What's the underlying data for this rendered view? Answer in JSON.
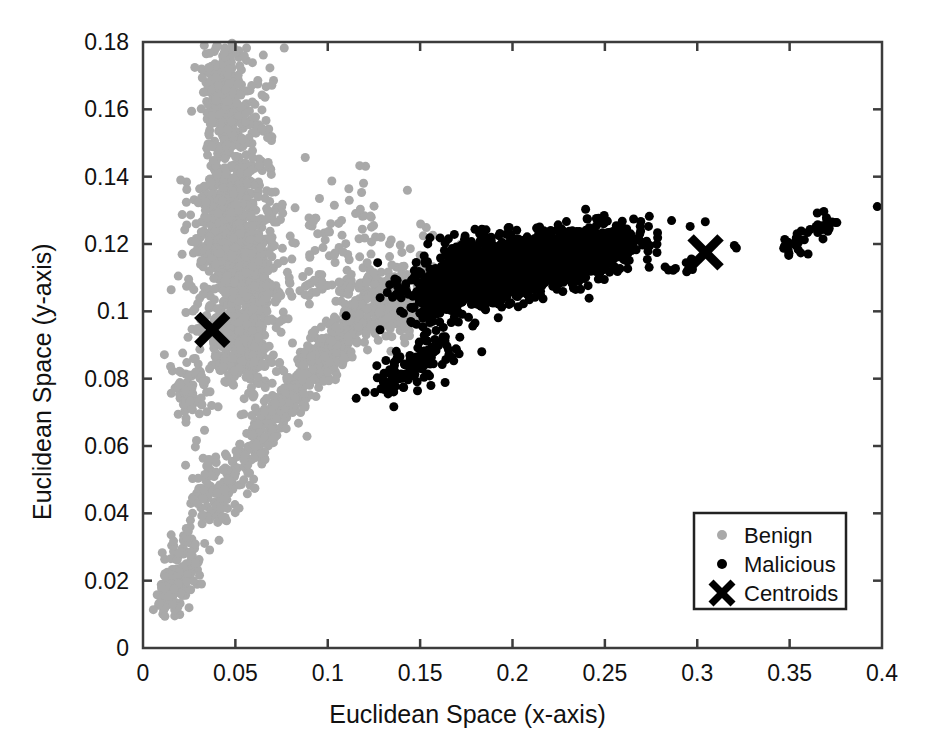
{
  "chart_data": {
    "type": "scatter",
    "title": "",
    "xlabel": "Euclidean Space (x-axis)",
    "ylabel": "Euclidean Space (y-axis)",
    "xlim": [
      0,
      0.4
    ],
    "ylim": [
      0,
      0.18
    ],
    "xticks": [
      0,
      0.05,
      0.1,
      0.15,
      0.2,
      0.25,
      0.3,
      0.35,
      0.4
    ],
    "xtick_labels": [
      "0",
      "0.05",
      "0.1",
      "0.15",
      "0.2",
      "0.25",
      "0.3",
      "0.35",
      "0.4"
    ],
    "yticks": [
      0,
      0.02,
      0.04,
      0.06,
      0.08,
      0.1,
      0.12,
      0.14,
      0.16,
      0.18
    ],
    "ytick_labels": [
      "0",
      "0.02",
      "0.04",
      "0.06",
      "0.08",
      "0.1",
      "0.12",
      "0.14",
      "0.16",
      "0.18"
    ],
    "grid": false,
    "legend_position": "lower right",
    "series": [
      {
        "name": "Benign",
        "marker": "circle",
        "color": "#a9a9a9",
        "marker_size": 9,
        "clusters": [
          {
            "label": "upper-vertical-spine",
            "cx": 0.046,
            "cy": 0.133,
            "sx": 0.0085,
            "sy": 0.0215,
            "n": 520,
            "rot": -0.2
          },
          {
            "label": "upper-spine-top",
            "cx": 0.042,
            "cy": 0.165,
            "sx": 0.0055,
            "sy": 0.0075,
            "n": 190,
            "rot": 0.0
          },
          {
            "label": "spine-mid-bulge",
            "cx": 0.055,
            "cy": 0.117,
            "sx": 0.0105,
            "sy": 0.0135,
            "n": 320,
            "rot": -0.25
          },
          {
            "label": "spine-lower",
            "cx": 0.057,
            "cy": 0.1,
            "sx": 0.0095,
            "sy": 0.0105,
            "n": 240,
            "rot": -0.1
          },
          {
            "label": "spine-foot",
            "cx": 0.052,
            "cy": 0.088,
            "sx": 0.0075,
            "sy": 0.006,
            "n": 120,
            "rot": 0.0
          },
          {
            "label": "diagonal-band-upper",
            "cx": 0.118,
            "cy": 0.098,
            "sx": 0.019,
            "sy": 0.0045,
            "n": 300,
            "rot": 0.5
          },
          {
            "label": "diagonal-band-mid",
            "cx": 0.092,
            "cy": 0.082,
            "sx": 0.016,
            "sy": 0.0042,
            "n": 250,
            "rot": 0.55
          },
          {
            "label": "diagonal-band-low",
            "cx": 0.062,
            "cy": 0.062,
            "sx": 0.0115,
            "sy": 0.0035,
            "n": 150,
            "rot": 0.7
          },
          {
            "label": "diagonal-islet-a",
            "cx": 0.038,
            "cy": 0.045,
            "sx": 0.006,
            "sy": 0.0055,
            "n": 90,
            "rot": 0.75
          },
          {
            "label": "diagonal-islet-b",
            "cx": 0.022,
            "cy": 0.024,
            "sx": 0.0065,
            "sy": 0.0045,
            "n": 110,
            "rot": 0.85
          },
          {
            "label": "diagonal-islet-c",
            "cx": 0.014,
            "cy": 0.015,
            "sx": 0.004,
            "sy": 0.0028,
            "n": 60,
            "rot": 0.85
          },
          {
            "label": "left-lobe",
            "cx": 0.025,
            "cy": 0.077,
            "sx": 0.006,
            "sy": 0.005,
            "n": 70,
            "rot": 0.0
          },
          {
            "label": "scatter-cloud-right",
            "cx": 0.105,
            "cy": 0.122,
            "sx": 0.016,
            "sy": 0.011,
            "n": 70,
            "rot": 0.0
          },
          {
            "label": "horizontal-streak",
            "cx": 0.105,
            "cy": 0.108,
            "sx": 0.017,
            "sy": 0.0016,
            "n": 45,
            "rot": 0.0
          },
          {
            "label": "bridge-to-black",
            "cx": 0.143,
            "cy": 0.1,
            "sx": 0.008,
            "sy": 0.0035,
            "n": 110,
            "rot": 0.35
          }
        ]
      },
      {
        "name": "Malicious",
        "marker": "circle",
        "color": "#000000",
        "marker_size": 9,
        "clusters": [
          {
            "label": "main-dense-wedge",
            "cx": 0.205,
            "cy": 0.113,
            "sx": 0.027,
            "sy": 0.0042,
            "n": 1400,
            "rot": 0.13
          },
          {
            "label": "main-core",
            "cx": 0.215,
            "cy": 0.115,
            "sx": 0.022,
            "sy": 0.003,
            "n": 900,
            "rot": 0.12
          },
          {
            "label": "main-tip",
            "cx": 0.244,
            "cy": 0.119,
            "sx": 0.0085,
            "sy": 0.0016,
            "n": 260,
            "rot": 0.08
          },
          {
            "label": "main-left-fan",
            "cx": 0.168,
            "cy": 0.108,
            "sx": 0.013,
            "sy": 0.0048,
            "n": 320,
            "rot": 0.22
          },
          {
            "label": "upper-sparse",
            "cx": 0.182,
            "cy": 0.12,
            "sx": 0.012,
            "sy": 0.0028,
            "n": 40,
            "rot": 0.0
          },
          {
            "label": "lower-band",
            "cx": 0.152,
            "cy": 0.086,
            "sx": 0.011,
            "sy": 0.0035,
            "n": 85,
            "rot": 0.3
          },
          {
            "label": "lower-band-left",
            "cx": 0.134,
            "cy": 0.081,
            "sx": 0.005,
            "sy": 0.0028,
            "n": 35,
            "rot": 0.3
          },
          {
            "label": "right-group-a",
            "cx": 0.285,
            "cy": 0.111,
            "sx": 0.002,
            "sy": 0.0012,
            "n": 4,
            "rot": 0.0
          },
          {
            "label": "right-group-b",
            "cx": 0.295,
            "cy": 0.114,
            "sx": 0.003,
            "sy": 0.0012,
            "n": 6,
            "rot": 0.0
          },
          {
            "label": "right-single",
            "cx": 0.322,
            "cy": 0.1185,
            "sx": 0.0012,
            "sy": 0.0008,
            "n": 2,
            "rot": 0.0
          },
          {
            "label": "far-right-cluster",
            "cx": 0.353,
            "cy": 0.1205,
            "sx": 0.0045,
            "sy": 0.0018,
            "n": 26,
            "rot": 0.18
          },
          {
            "label": "far-right-cluster-b",
            "cx": 0.368,
            "cy": 0.1245,
            "sx": 0.004,
            "sy": 0.0022,
            "n": 22,
            "rot": 0.25
          },
          {
            "label": "far-right-outlier",
            "cx": 0.397,
            "cy": 0.1318,
            "sx": 0.0008,
            "sy": 0.0006,
            "n": 1,
            "rot": 0.0
          }
        ]
      },
      {
        "name": "Centroids",
        "marker": "x",
        "color": "#000000",
        "marker_size": 30,
        "points": [
          {
            "x": 0.0375,
            "y": 0.0945
          },
          {
            "x": 0.3045,
            "y": 0.1175
          }
        ]
      }
    ],
    "legend_entries": [
      {
        "label": "Benign",
        "marker": "circle",
        "color": "#a9a9a9"
      },
      {
        "label": "Malicious",
        "marker": "circle",
        "color": "#000000"
      },
      {
        "label": "Centroids",
        "marker": "x",
        "color": "#000000"
      }
    ]
  },
  "colors": {
    "benign": "#a9a9a9",
    "malicious": "#000000",
    "centroid": "#000000",
    "axis": "#3c3c3c",
    "background": "#ffffff"
  }
}
